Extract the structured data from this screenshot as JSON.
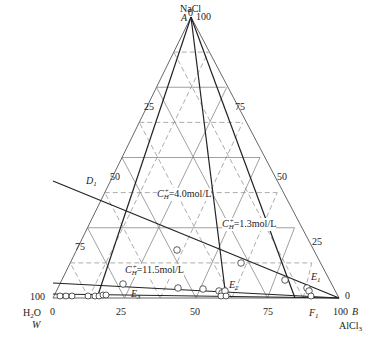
{
  "diagram": {
    "type": "ternary-phase-diagram",
    "components": {
      "top": {
        "name": "NaCl",
        "vertex": "A"
      },
      "left": {
        "name": "H2O",
        "vertex": "W"
      },
      "right": {
        "name": "AlCl3",
        "vertex": "B"
      }
    },
    "vertex_labels": {
      "A": "A",
      "W": "W",
      "B": "B",
      "NaCl": "NaCl",
      "H2O_main": "H",
      "H2O_sub": "2",
      "H2O_tail": "O",
      "AlCl3_main": "AlCl",
      "AlCl3_sub": "3"
    },
    "tick_labels": {
      "top_left_zero": "0",
      "top_right_hundred": "100",
      "left_side": [
        "25",
        "50",
        "75",
        "100"
      ],
      "right_side": [
        "75",
        "50",
        "25",
        "0"
      ],
      "bottom_left_zero": "0",
      "bottom": [
        "25",
        "50",
        "75",
        "100"
      ]
    },
    "point_labels": {
      "D1_main": "D",
      "D1_sub": "1",
      "E1_main": "E",
      "E1_sub": "1",
      "E2_main": "E",
      "E2_sub": "2",
      "E3_main": "E",
      "E3_sub": "3",
      "F1_main": "F",
      "F1_sub": "1"
    },
    "concentration_labels": [
      {
        "symbol": "C",
        "sub": "H",
        "sup": "+",
        "value": "=4.0mol/L"
      },
      {
        "symbol": "C",
        "sub": "H",
        "sup": "+",
        "value": "=1.3mol/L"
      },
      {
        "symbol": "C",
        "sub": "H",
        "sup": "+",
        "value": "=11.5mol/L"
      }
    ],
    "colors": {
      "line": "#333333",
      "grid": "#666666",
      "background": "#ffffff"
    }
  }
}
